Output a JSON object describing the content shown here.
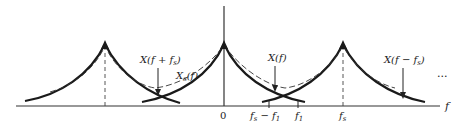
{
  "diagram": {
    "axis": {
      "label": "f",
      "ticks": [
        {
          "label": "0"
        },
        {
          "label": "f_s − f_1"
        },
        {
          "label": "f_1"
        },
        {
          "label": "f_s"
        }
      ]
    },
    "annotations": {
      "x_f_plus_fs": "X(f + f",
      "x_f_plus_fs_sub": "s",
      "x_f_plus_fs_close": ")",
      "xs_f": "X",
      "xs_f_sub": "s",
      "xs_f_close": "(f)",
      "x_f": "X(f)",
      "x_f_minus_fs": "X(f − f",
      "x_f_minus_fs_sub": "s",
      "x_f_minus_fs_close": ")",
      "ellipsis": "..."
    },
    "tick_labels": {
      "zero": "0",
      "fs_minus_f1_a": "f",
      "fs_minus_f1_sub": "s",
      "fs_minus_f1_b": " − f",
      "fs_minus_f1_sub2": "1",
      "f1": "f",
      "f1_sub": "1",
      "fs": "f",
      "fs_sub": "s",
      "axis_f": "f"
    },
    "legend": {
      "solid": "individual spectral replicas X(f + k·f_s)",
      "dashed": "sum X_s(f)"
    },
    "colors": {
      "ink": "#222222",
      "background": "#ffffff"
    }
  }
}
